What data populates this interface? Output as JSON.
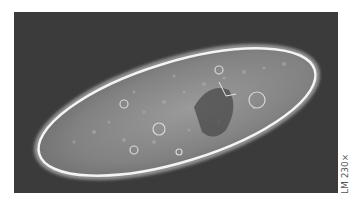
{
  "figure": {
    "background_color": "#3a3a3a",
    "cell_fill": "#8a8a8a",
    "cell_outline": "#f2f2f2"
  },
  "caption": {
    "magnification_label": "LM 230×"
  }
}
